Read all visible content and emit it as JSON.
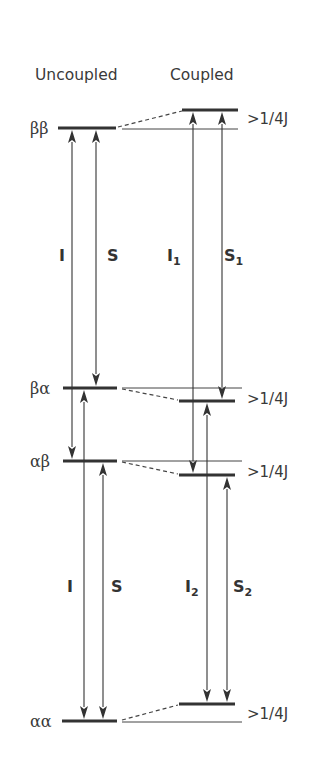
{
  "headers": {
    "uncoupled": "Uncoupled",
    "coupled": "Coupled"
  },
  "states": [
    {
      "id": "bb",
      "label": "ββ",
      "uncoupled_y": 128,
      "coupled_y": 110
    },
    {
      "id": "ba",
      "label": "βα",
      "uncoupled_y": 388,
      "coupled_y": 401
    },
    {
      "id": "ab",
      "label": "αβ",
      "uncoupled_y": 461,
      "coupled_y": 475
    },
    {
      "id": "aa",
      "label": "αα",
      "uncoupled_y": 721,
      "coupled_y": 704
    }
  ],
  "coupling_label": ">1/4J",
  "transitions": {
    "uncoupled": [
      {
        "name": "I",
        "sub": "",
        "from": "ab",
        "to": "bb",
        "x": 72,
        "dir": "up"
      },
      {
        "name": "S",
        "sub": "",
        "from": "ba",
        "to": "bb",
        "x": 96,
        "dir": "up"
      },
      {
        "name": "I",
        "sub": "",
        "from": "aa",
        "to": "ba",
        "x": 84,
        "dir": "up"
      },
      {
        "name": "S",
        "sub": "",
        "from": "aa",
        "to": "ab",
        "x": 103,
        "dir": "up"
      }
    ],
    "coupled": [
      {
        "name": "I",
        "sub": "1",
        "from": "ab",
        "to": "bb",
        "x": 193,
        "dir": "up"
      },
      {
        "name": "S",
        "sub": "1",
        "from": "ba",
        "to": "bb",
        "x": 222,
        "dir": "up"
      },
      {
        "name": "I",
        "sub": "2",
        "from": "aa",
        "to": "ba",
        "x": 207,
        "dir": "up"
      },
      {
        "name": "S",
        "sub": "2",
        "from": "aa",
        "to": "ab",
        "x": 227,
        "dir": "up"
      }
    ]
  },
  "labels": {
    "upper_uncoupled_I": "I",
    "upper_uncoupled_S": "S",
    "upper_coupled_I": "I",
    "upper_coupled_I_sub": "1",
    "upper_coupled_S": "S",
    "upper_coupled_S_sub": "1",
    "lower_uncoupled_I": "I",
    "lower_uncoupled_S": "S",
    "lower_coupled_I": "I",
    "lower_coupled_I_sub": "2",
    "lower_coupled_S": "S",
    "lower_coupled_S_sub": "2"
  },
  "colors": {
    "line": "#333333",
    "text": "#3a3a3a",
    "background": "#ffffff"
  }
}
